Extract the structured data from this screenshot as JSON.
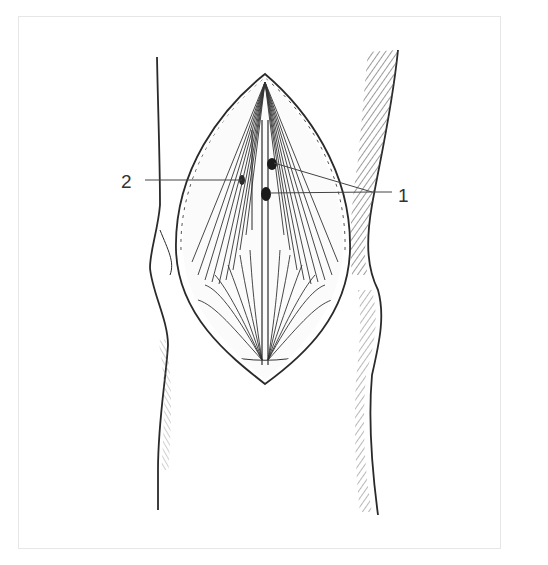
{
  "figure": {
    "type": "anatomical-illustration",
    "colors": {
      "ink": "#2a2a2a",
      "frame": "#e6e6e6",
      "background": "#ffffff"
    },
    "labels": [
      {
        "id": "label-2",
        "text": "2",
        "x": 121,
        "y": 172,
        "leader": [
          [
            145,
            180
          ],
          [
            242,
            180
          ]
        ]
      },
      {
        "id": "label-1",
        "text": "1",
        "x": 398,
        "y": 187,
        "leaders": [
          [
            [
              274,
              163
            ],
            [
              372,
              192
            ]
          ],
          [
            [
              270,
              193
            ],
            [
              372,
              192
            ]
          ],
          [
            [
              372,
              192
            ],
            [
              392,
              192
            ]
          ]
        ]
      }
    ]
  }
}
